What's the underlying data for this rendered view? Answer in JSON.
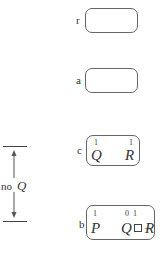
{
  "states": [
    {
      "id": "r",
      "label": "r",
      "atoms": []
    },
    {
      "id": "a",
      "label": "a",
      "atoms": []
    },
    {
      "id": "c",
      "label": "c",
      "atoms": [
        {
          "symbol": "Q",
          "value": "1"
        },
        {
          "symbol": "R",
          "value": "1"
        }
      ]
    },
    {
      "id": "b",
      "label": "b",
      "atoms": [
        {
          "symbol": "P",
          "value": "1"
        },
        {
          "symbol": "Q",
          "value": "0"
        },
        {
          "symbol": "R",
          "value": "1"
        }
      ]
    }
  ],
  "interval": {
    "label": "no",
    "symbol": "Q"
  },
  "connective": "□→"
}
